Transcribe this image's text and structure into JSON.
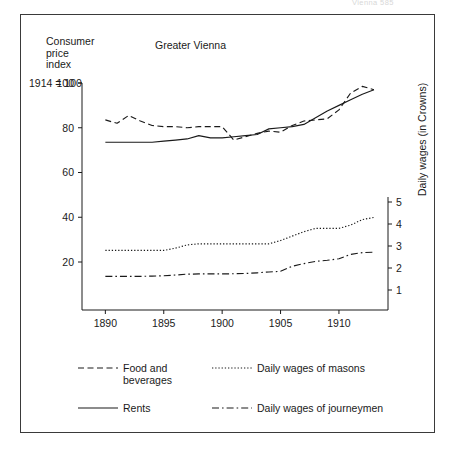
{
  "page": {
    "header_text": "Vienna 585"
  },
  "chart_data": {
    "type": "line",
    "title": "Greater Vienna",
    "xlabel": "",
    "ylabel": "Consumer\nprice\nindex",
    "ylabel_note": "1914 = 100",
    "y2label": "Daily wages (in Crowns)",
    "grid": false,
    "legend_position": "below",
    "xlim": [
      1888.0,
      1914.2
    ],
    "ylim": [
      0,
      110
    ],
    "y2lim": [
      0,
      10.0
    ],
    "xticks": [
      1890,
      1895,
      1900,
      1905,
      1910
    ],
    "xtick_labels": [
      "1890",
      "1895",
      "1900",
      "1905",
      "1910"
    ],
    "yticks": [
      20,
      40,
      60,
      80,
      100
    ],
    "ytick_labels": [
      "20",
      "40",
      "60",
      "80",
      "100"
    ],
    "y2ticks": [
      1,
      2,
      3,
      4,
      5
    ],
    "y2tick_labels": [
      "1",
      "2",
      "3",
      "4",
      "5"
    ],
    "x": [
      1890,
      1891,
      1892,
      1893,
      1894,
      1895,
      1896,
      1897,
      1898,
      1899,
      1900,
      1901,
      1902,
      1903,
      1904,
      1905,
      1906,
      1907,
      1908,
      1909,
      1910,
      1911,
      1912,
      1913
    ],
    "series": [
      {
        "name": "Food and beverages",
        "axis": "left",
        "style": "dashed",
        "unit": "index (1914 = 100)",
        "values": [
          83.5,
          82.0,
          85.5,
          83.0,
          81.0,
          80.5,
          80.5,
          80.0,
          80.5,
          80.5,
          80.5,
          74.5,
          76.0,
          77.5,
          78.5,
          78.0,
          81.0,
          83.0,
          83.5,
          84.0,
          88.0,
          95.5,
          98.5,
          97.0
        ]
      },
      {
        "name": "Rents",
        "axis": "left",
        "style": "solid",
        "unit": "index (1914 = 100)",
        "values": [
          73.5,
          73.5,
          73.5,
          73.5,
          73.5,
          74.0,
          74.5,
          75.0,
          76.5,
          75.5,
          75.5,
          76.0,
          76.5,
          77.0,
          79.5,
          80.0,
          80.5,
          81.5,
          84.5,
          87.5,
          90.0,
          92.5,
          95.0,
          97.0
        ]
      },
      {
        "name": "Daily wages of masons",
        "axis": "right",
        "style": "dotted",
        "unit": "Crowns",
        "values": [
          2.8,
          2.8,
          2.8,
          2.8,
          2.8,
          2.8,
          2.9,
          3.05,
          3.1,
          3.1,
          3.1,
          3.1,
          3.1,
          3.1,
          3.1,
          3.25,
          3.45,
          3.65,
          3.8,
          3.8,
          3.8,
          3.95,
          4.2,
          4.3
        ]
      },
      {
        "name": "Daily wages of journeymen",
        "axis": "right",
        "style": "dashdot",
        "unit": "Crowns",
        "values": [
          1.62,
          1.62,
          1.62,
          1.62,
          1.63,
          1.65,
          1.68,
          1.72,
          1.73,
          1.73,
          1.73,
          1.74,
          1.75,
          1.78,
          1.82,
          1.85,
          2.08,
          2.2,
          2.3,
          2.35,
          2.42,
          2.62,
          2.7,
          2.72
        ]
      }
    ]
  },
  "legend": {
    "items": [
      {
        "label": "Food and\nbeverages",
        "style": "dashed"
      },
      {
        "label": "Daily wages of masons",
        "style": "dotted"
      },
      {
        "label": "Rents",
        "style": "solid"
      },
      {
        "label": "Daily wages of journeymen",
        "style": "dashdot"
      }
    ]
  },
  "colors": {
    "line": "#1a1a1a",
    "border": "#3a3a3a",
    "background": "#ffffff"
  }
}
